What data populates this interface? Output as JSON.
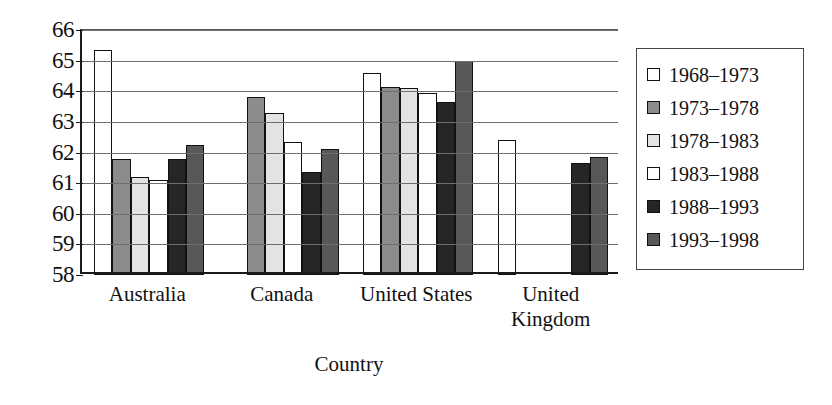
{
  "chart_data": {
    "type": "bar",
    "title": "",
    "xlabel": "Country",
    "ylabel": "",
    "ylim": [
      58,
      66
    ],
    "yticks": [
      66,
      65,
      64,
      63,
      62,
      61,
      60,
      59,
      58
    ],
    "grid": true,
    "legend_position": "right",
    "categories": [
      "Australia",
      "Canada",
      "United States",
      "United Kingdom"
    ],
    "category_labels": [
      "Australia",
      "Canada",
      "United States",
      "United\nKingdom"
    ],
    "series": [
      {
        "name": "1968–1973",
        "color": "#ffffff",
        "values": [
          65.35,
          null,
          64.6,
          62.4
        ]
      },
      {
        "name": "1973–1978",
        "color": "#8c8c8c",
        "values": [
          61.8,
          63.8,
          64.15,
          null
        ]
      },
      {
        "name": "1978–1983",
        "color": "#e3e3e3",
        "values": [
          61.2,
          63.3,
          64.1,
          null
        ]
      },
      {
        "name": "1983–1988",
        "color": "#ffffff",
        "values": [
          61.1,
          62.35,
          63.95,
          null
        ]
      },
      {
        "name": "1988–1993",
        "color": "#262626",
        "values": [
          61.8,
          61.35,
          63.65,
          61.65
        ]
      },
      {
        "name": "1993–1998",
        "color": "#585858",
        "values": [
          62.25,
          62.1,
          65.0,
          61.85
        ]
      }
    ]
  },
  "legend": {
    "items": [
      {
        "label": "1968–1973",
        "color": "#ffffff"
      },
      {
        "label": "1973–1978",
        "color": "#8c8c8c"
      },
      {
        "label": "1978–1983",
        "color": "#e3e3e3"
      },
      {
        "label": "1983–1988",
        "color": "#ffffff"
      },
      {
        "label": "1988–1993",
        "color": "#262626"
      },
      {
        "label": "1993–1998",
        "color": "#585858"
      }
    ]
  },
  "axis": {
    "x_title": "Country"
  }
}
